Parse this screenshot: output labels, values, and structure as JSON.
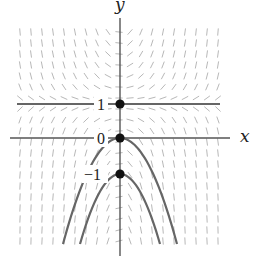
{
  "figure": {
    "type": "slope-field",
    "axes": {
      "x_label": "x",
      "y_label": "y",
      "origin_px": [
        120,
        138
      ],
      "unit_px": 35
    },
    "equilibrium_lines": [
      {
        "y": 1,
        "label": "1"
      }
    ],
    "solution_curves": [
      {
        "name": "solution-through-0",
        "y0": 0,
        "label": "0"
      },
      {
        "name": "solution-through-minus-1",
        "y0": -1,
        "label": "−1"
      }
    ],
    "points": [
      {
        "x": 0,
        "y": 1
      },
      {
        "x": 0,
        "y": 0
      },
      {
        "x": 0,
        "y": -1
      }
    ],
    "colors": {
      "axis": "#555555",
      "curve": "#666666",
      "slope_mark": "#b8b8b8",
      "point": "#111111"
    }
  }
}
